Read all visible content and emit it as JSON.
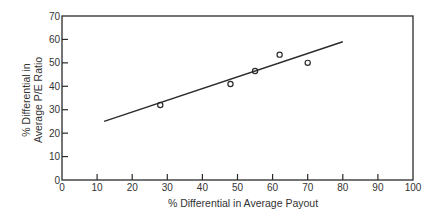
{
  "chart_data": {
    "type": "scatter",
    "title": "",
    "xlabel": "% Differential in Average Payout",
    "ylabel_lines": [
      "% Differential in",
      "Average P/E Ratio"
    ],
    "xlim": [
      0,
      100
    ],
    "ylim": [
      0,
      70
    ],
    "xticks": [
      0,
      10,
      20,
      30,
      40,
      50,
      60,
      70,
      80,
      90,
      100
    ],
    "yticks": [
      0,
      10,
      20,
      30,
      40,
      50,
      60,
      70
    ],
    "grid": false,
    "legend": null,
    "series": [
      {
        "name": "observations",
        "marker": "open-circle",
        "points": [
          {
            "x": 28,
            "y": 32
          },
          {
            "x": 48,
            "y": 41
          },
          {
            "x": 55,
            "y": 46.5
          },
          {
            "x": 62,
            "y": 53.5
          },
          {
            "x": 70,
            "y": 50
          }
        ]
      },
      {
        "name": "fitted-line",
        "type": "line",
        "points": [
          {
            "x": 12,
            "y": 25
          },
          {
            "x": 80,
            "y": 59
          }
        ]
      }
    ],
    "colors": {
      "axis": "#2a2a2a",
      "line": "#2a2a2a",
      "marker": "#2a2a2a",
      "text": "#333333"
    }
  }
}
